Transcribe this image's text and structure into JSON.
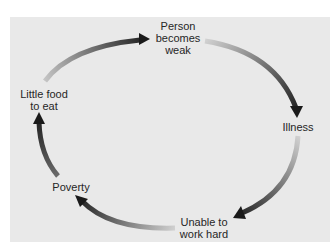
{
  "diagram": {
    "type": "cycle",
    "title": "",
    "colors": {
      "background_panel": "#e9e9e9",
      "arrow_tail": "#c8c8c8",
      "arrow_head": "#1a1a1a",
      "text": "#262626"
    },
    "nodes": [
      {
        "id": "weak",
        "label": "Person\nbecomes\nweak"
      },
      {
        "id": "illness",
        "label": "Illness"
      },
      {
        "id": "unable",
        "label": "Unable to\nwork hard"
      },
      {
        "id": "poverty",
        "label": "Poverty"
      },
      {
        "id": "food",
        "label": "Little food\nto eat"
      }
    ],
    "edges": [
      {
        "from": "food",
        "to": "weak"
      },
      {
        "from": "weak",
        "to": "illness"
      },
      {
        "from": "illness",
        "to": "unable"
      },
      {
        "from": "unable",
        "to": "poverty"
      },
      {
        "from": "poverty",
        "to": "food"
      }
    ]
  }
}
